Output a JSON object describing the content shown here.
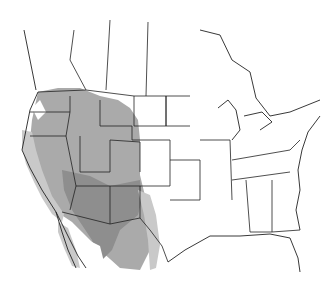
{
  "map": {
    "type": "species-range-map",
    "region": "North America (United States, southern Canada, northern Mexico)",
    "colors": {
      "background": "#ffffff",
      "border": "#222222",
      "range_light": "#c9c9c9",
      "range_medium": "#aaaaaa",
      "range_dark": "#8e8e8e"
    },
    "shaded_regions": [
      {
        "name": "northwest-rockies",
        "shade": "medium"
      },
      {
        "name": "great-basin-southwest",
        "shade": "dark"
      },
      {
        "name": "california-coast",
        "shade": "light"
      },
      {
        "name": "mexico-highlands",
        "shade": "medium"
      },
      {
        "name": "texas-west",
        "shade": "light"
      }
    ]
  }
}
